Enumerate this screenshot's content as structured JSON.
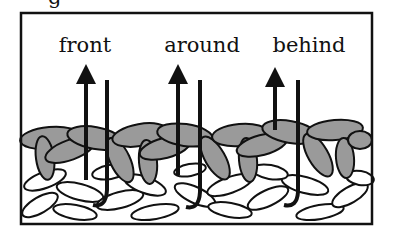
{
  "figure": {
    "partial_caption_glyph": "g",
    "labels": [
      {
        "text": "front",
        "x": 85
      },
      {
        "text": "around",
        "x": 202
      },
      {
        "text": "behind",
        "x": 309
      }
    ],
    "hooks": [
      {
        "arrow_x": 86,
        "hook_x": 107,
        "bottom_y": 208
      },
      {
        "arrow_x": 178,
        "hook_x": 200,
        "bottom_y": 210
      },
      {
        "arrow_x": 275,
        "hook_x": 298,
        "bottom_y": 208
      }
    ],
    "colors": {
      "frame": "#111111",
      "braid_fill": "#9a9a9a",
      "stitch_fill": "#ffffff",
      "outline": "#111111"
    }
  }
}
